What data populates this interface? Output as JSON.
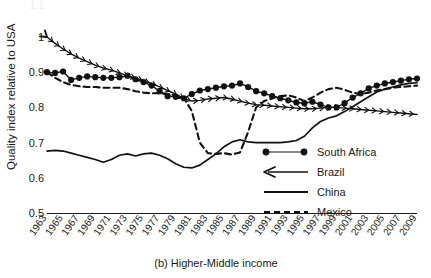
{
  "chart_data": {
    "type": "line",
    "title": "",
    "caption": "(b) Higher-Middle income",
    "xlabel": "",
    "ylabel": "Quality index relative to USA",
    "ylim": [
      0.5,
      1.1
    ],
    "xlim": [
      1963,
      2009
    ],
    "grid": false,
    "legend_position": "inside-bottom-right",
    "y_ticks": [
      "0.5",
      "0.6",
      "0.7",
      "0.8",
      "0.9",
      "1"
    ],
    "y_tick_values": [
      0.5,
      0.6,
      0.7,
      0.8,
      0.9,
      1.0
    ],
    "y_tick_clipped_top": "1.1",
    "x_ticks": [
      "1963",
      "1965",
      "1967",
      "1969",
      "1971",
      "1973",
      "1975",
      "1977",
      "1979",
      "1981",
      "1983",
      "1985",
      "1987",
      "1989",
      "1991",
      "1993",
      "1995",
      "1997",
      "1999",
      "2001",
      "2003",
      "2005",
      "2007",
      "2009"
    ],
    "x": [
      1963,
      1964,
      1965,
      1966,
      1967,
      1968,
      1969,
      1970,
      1971,
      1972,
      1973,
      1974,
      1975,
      1976,
      1977,
      1978,
      1979,
      1980,
      1981,
      1982,
      1983,
      1984,
      1985,
      1986,
      1987,
      1988,
      1989,
      1990,
      1991,
      1992,
      1993,
      1994,
      1995,
      1996,
      1997,
      1998,
      1999,
      2000,
      2001,
      2002,
      2003,
      2004,
      2005,
      2006,
      2007,
      2008,
      2009
    ],
    "series": [
      {
        "name": "South Africa",
        "marker": "filled-circle",
        "style": "solid-with-markers",
        "values": [
          0.9,
          0.898,
          0.902,
          0.878,
          0.884,
          0.888,
          0.886,
          0.884,
          0.884,
          0.886,
          0.89,
          0.88,
          0.872,
          0.862,
          0.846,
          0.832,
          0.83,
          0.826,
          0.838,
          0.848,
          0.852,
          0.856,
          0.86,
          0.862,
          0.868,
          0.858,
          0.846,
          0.84,
          0.832,
          0.826,
          0.82,
          0.814,
          0.812,
          0.816,
          0.808,
          0.8,
          0.8,
          0.812,
          0.828,
          0.84,
          0.854,
          0.862,
          0.868,
          0.872,
          0.876,
          0.88,
          0.882
        ]
      },
      {
        "name": "Brazil",
        "marker": "arrow-chevron",
        "style": "solid-with-chevrons",
        "values": [
          1.0,
          0.982,
          0.966,
          0.952,
          0.94,
          0.93,
          0.92,
          0.912,
          0.906,
          0.898,
          0.89,
          0.884,
          0.876,
          0.868,
          0.858,
          0.848,
          0.838,
          0.826,
          0.818,
          0.82,
          0.824,
          0.826,
          0.828,
          0.824,
          0.818,
          0.812,
          0.808,
          0.806,
          0.804,
          0.802,
          0.8,
          0.798,
          0.796,
          0.796,
          0.798,
          0.8,
          0.8,
          0.798,
          0.796,
          0.794,
          0.792,
          0.79,
          0.788,
          0.786,
          0.784,
          0.782,
          0.78
        ]
      },
      {
        "name": "China",
        "marker": "none",
        "style": "solid",
        "values": [
          0.676,
          0.678,
          0.676,
          0.67,
          0.664,
          0.658,
          0.652,
          0.644,
          0.652,
          0.664,
          0.668,
          0.662,
          0.668,
          0.67,
          0.664,
          0.654,
          0.64,
          0.63,
          0.628,
          0.636,
          0.652,
          0.668,
          0.688,
          0.702,
          0.708,
          0.702,
          0.7,
          0.7,
          0.7,
          0.7,
          0.702,
          0.706,
          0.718,
          0.742,
          0.76,
          0.77,
          0.776,
          0.788,
          0.802,
          0.816,
          0.83,
          0.844,
          0.852,
          0.858,
          0.864,
          0.868,
          0.87
        ]
      },
      {
        "name": "Mexico",
        "marker": "none",
        "style": "dashed",
        "values": [
          0.9,
          0.884,
          0.872,
          0.864,
          0.86,
          0.858,
          0.858,
          0.856,
          0.856,
          0.856,
          0.852,
          0.846,
          0.842,
          0.84,
          0.84,
          0.838,
          0.834,
          0.828,
          0.79,
          0.7,
          0.67,
          0.668,
          0.67,
          0.666,
          0.672,
          0.73,
          0.8,
          0.818,
          0.826,
          0.832,
          0.834,
          0.828,
          0.818,
          0.828,
          0.842,
          0.852,
          0.856,
          0.85,
          0.842,
          0.838,
          0.842,
          0.848,
          0.852,
          0.856,
          0.858,
          0.86,
          0.862
        ]
      }
    ],
    "legend": [
      {
        "label": "South Africa",
        "style": "solid-with-markers"
      },
      {
        "label": "Brazil",
        "style": "solid-with-chevrons"
      },
      {
        "label": "China",
        "style": "solid"
      },
      {
        "label": "Mexico",
        "style": "dashed"
      }
    ],
    "colors": {
      "series": "#111111",
      "axis": "#1a1a1a",
      "background": "#ffffff"
    }
  }
}
